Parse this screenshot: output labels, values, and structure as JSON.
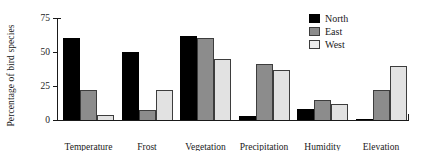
{
  "chart_data": {
    "type": "bar",
    "title": "",
    "xlabel": "",
    "ylabel": "Percentage of bird species",
    "categories": [
      "Temperature",
      "Frost",
      "Vegetation",
      "Precipitation",
      "Humidity",
      "Elevation"
    ],
    "series": [
      {
        "name": "North",
        "color": "#000000",
        "values": [
          60,
          50,
          62,
          3,
          8,
          1
        ]
      },
      {
        "name": "East",
        "color": "#8c8c8c",
        "values": [
          22,
          7,
          60,
          41,
          15,
          22
        ]
      },
      {
        "name": "West",
        "color": "#e2e2e2",
        "values": [
          4,
          22,
          45,
          37,
          12,
          40
        ]
      }
    ],
    "ylim": [
      0,
      75
    ],
    "yticks": [
      0,
      25,
      50,
      75
    ],
    "ytick_labels": [
      "0",
      "25",
      "50",
      "75"
    ],
    "grid": false,
    "legend_position": "top-right"
  },
  "legend": {
    "items": [
      {
        "label": "North"
      },
      {
        "label": "East"
      },
      {
        "label": "West"
      }
    ]
  }
}
